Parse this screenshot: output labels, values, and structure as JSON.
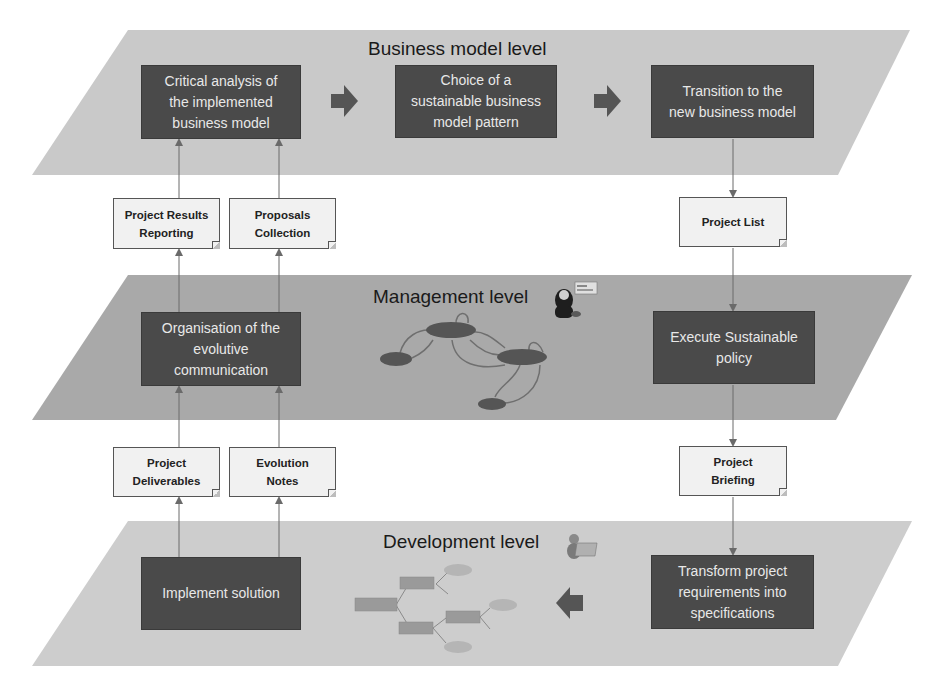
{
  "layers": {
    "business": {
      "title": "Business model level",
      "fill": "#c9c9c9"
    },
    "management": {
      "title": "Management level",
      "fill": "#a9a9a9"
    },
    "development": {
      "title": "Development level",
      "fill": "#cdcdcd"
    }
  },
  "process_boxes": {
    "critical_analysis": "Critical analysis of\nthe implemented\nbusiness model",
    "choice_pattern": "Choice of a\nsustainable business\nmodel pattern",
    "transition": "Transition to the\nnew business model",
    "organisation": "Organisation of the\nevolutive\ncommunication",
    "execute_policy": "Execute Sustainable\npolicy",
    "implement_solution": "Implement solution",
    "transform_requirements": "Transform project\nrequirements into\nspecifications"
  },
  "documents": {
    "project_results_reporting": "Project Results\nReporting",
    "proposals_collection": "Proposals\nCollection",
    "project_list": "Project List",
    "project_deliverables": "Project\nDeliverables",
    "evolution_notes": "Evolution\nNotes",
    "project_briefing": "Project\nBriefing"
  },
  "icons": {
    "management_icon": "manager-person-icon",
    "development_icon": "developer-person-icon",
    "management_graph": "state-graph-icon",
    "development_tree": "tree-diagram-icon"
  },
  "colors": {
    "process_fill": "#4a4a4a",
    "process_text": "#e8e8e8",
    "note_fill": "#f1f1f1",
    "connector": "#6a6a6a",
    "block_arrow": "#555555"
  }
}
